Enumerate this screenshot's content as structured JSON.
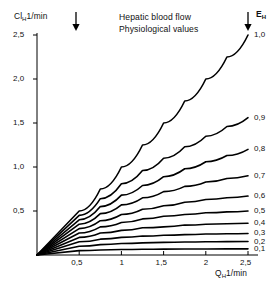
{
  "chart_data": {
    "type": "line",
    "title": "Hepatic blood flow",
    "subtitle": "Physiological values",
    "xlabel": "Q_H 1/min",
    "ylabel": "Cl_H 1/min",
    "xlabel_main": "Q",
    "xlabel_sub": "H",
    "xlabel_unit": "1/min",
    "ylabel_main": "Cl",
    "ylabel_sub": "H",
    "ylabel_unit": "1/min",
    "legend_title_main": "E",
    "legend_title_sub": "H",
    "legend_position": "right",
    "grid": false,
    "xlim": [
      0,
      2.5
    ],
    "ylim": [
      0,
      2.5
    ],
    "xticks": [
      0.5,
      1,
      1.5,
      2,
      2.5
    ],
    "xticklabels": [
      "0,5",
      "1",
      "1,5",
      "2",
      "2,5"
    ],
    "yticks": [
      0.5,
      1.0,
      1.5,
      2.0,
      2.5
    ],
    "yticklabels": [
      "0,5",
      "1,0",
      "1,5",
      "2,0",
      "2,5"
    ],
    "annotations": [
      {
        "name": "arrow-physiological-flow",
        "x": 0.5,
        "text": ""
      },
      {
        "name": "arrow-extraction-axis",
        "x": 2.5,
        "text": ""
      }
    ],
    "series": [
      {
        "name": "E_H = 1,0",
        "label": "1,0",
        "E": 1.0,
        "x": [
          0,
          0.5,
          0.75,
          1,
          1.25,
          1.5,
          1.75,
          2,
          2.25,
          2.5
        ],
        "y": [
          0,
          0.5,
          0.75,
          1.0,
          1.25,
          1.5,
          1.75,
          2.0,
          2.25,
          2.5
        ]
      },
      {
        "name": "E_H = 0,9",
        "label": "0,9",
        "E": 0.9,
        "x": [
          0,
          0.5,
          0.75,
          1,
          1.25,
          1.5,
          1.75,
          2,
          2.25,
          2.5
        ],
        "y": [
          0,
          0.45,
          0.64,
          0.81,
          0.96,
          1.1,
          1.23,
          1.35,
          1.46,
          1.56
        ]
      },
      {
        "name": "E_H = 0,8",
        "label": "0,8",
        "E": 0.8,
        "x": [
          0,
          0.5,
          0.75,
          1,
          1.25,
          1.5,
          1.75,
          2,
          2.25,
          2.5
        ],
        "y": [
          0,
          0.4,
          0.55,
          0.68,
          0.79,
          0.89,
          0.98,
          1.06,
          1.13,
          1.2
        ]
      },
      {
        "name": "E_H = 0,7",
        "label": "0,7",
        "E": 0.7,
        "x": [
          0,
          0.5,
          0.75,
          1,
          1.25,
          1.5,
          1.75,
          2,
          2.25,
          2.5
        ],
        "y": [
          0,
          0.35,
          0.47,
          0.57,
          0.65,
          0.72,
          0.78,
          0.83,
          0.87,
          0.9
        ]
      },
      {
        "name": "E_H = 0,6",
        "label": "0,6",
        "E": 0.6,
        "x": [
          0,
          0.5,
          0.75,
          1,
          1.25,
          1.5,
          1.75,
          2,
          2.25,
          2.5
        ],
        "y": [
          0,
          0.3,
          0.39,
          0.46,
          0.52,
          0.56,
          0.6,
          0.63,
          0.65,
          0.67
        ]
      },
      {
        "name": "E_H = 0,5",
        "label": "0,5",
        "E": 0.5,
        "x": [
          0,
          0.5,
          0.75,
          1,
          1.25,
          1.5,
          1.75,
          2,
          2.25,
          2.5
        ],
        "y": [
          0,
          0.25,
          0.32,
          0.37,
          0.41,
          0.44,
          0.46,
          0.48,
          0.49,
          0.5
        ]
      },
      {
        "name": "E_H = 0,4",
        "label": "0,4",
        "E": 0.4,
        "x": [
          0,
          0.5,
          0.75,
          1,
          1.25,
          1.5,
          1.75,
          2,
          2.25,
          2.5
        ],
        "y": [
          0,
          0.2,
          0.25,
          0.28,
          0.31,
          0.32,
          0.34,
          0.35,
          0.355,
          0.36
        ]
      },
      {
        "name": "E_H = 0,3",
        "label": "0,3",
        "E": 0.3,
        "x": [
          0,
          0.5,
          0.75,
          1,
          1.25,
          1.5,
          1.75,
          2,
          2.25,
          2.5
        ],
        "y": [
          0,
          0.15,
          0.18,
          0.2,
          0.215,
          0.225,
          0.232,
          0.238,
          0.242,
          0.245
        ]
      },
      {
        "name": "E_H = 0,2",
        "label": "0,2",
        "E": 0.2,
        "x": [
          0,
          0.5,
          0.75,
          1,
          1.25,
          1.5,
          1.75,
          2,
          2.25,
          2.5
        ],
        "y": [
          0,
          0.1,
          0.118,
          0.13,
          0.138,
          0.143,
          0.147,
          0.15,
          0.152,
          0.153
        ]
      },
      {
        "name": "E_H = 0,1",
        "label": "0,1",
        "E": 0.1,
        "x": [
          0,
          0.5,
          0.75,
          1,
          1.25,
          1.5,
          1.75,
          2,
          2.25,
          2.5
        ],
        "y": [
          0,
          0.05,
          0.057,
          0.062,
          0.065,
          0.067,
          0.068,
          0.069,
          0.0695,
          0.07
        ]
      }
    ]
  }
}
